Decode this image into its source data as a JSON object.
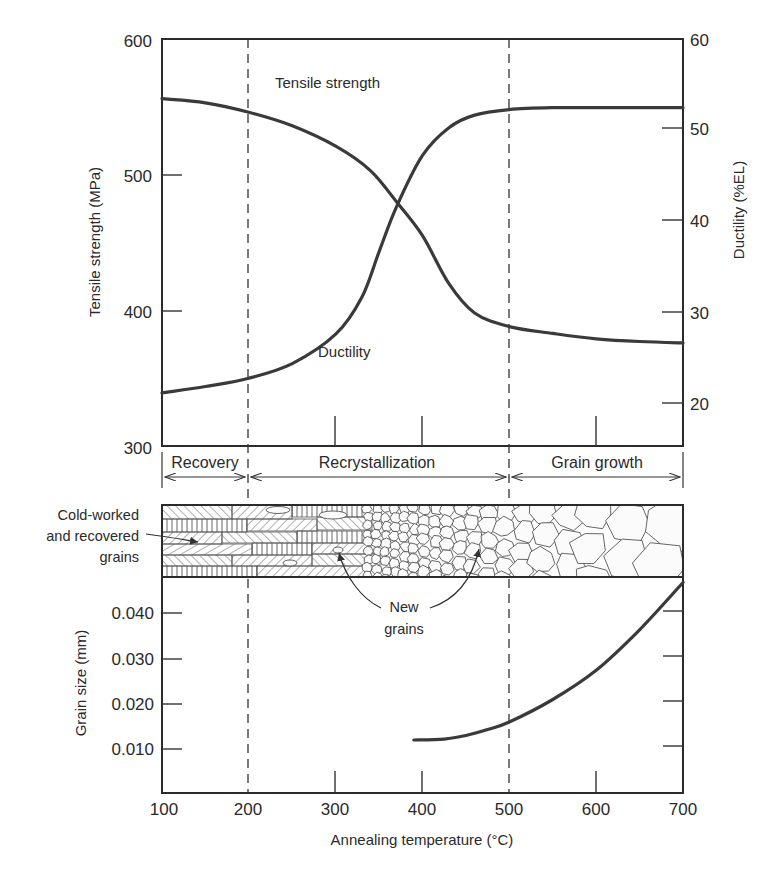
{
  "chart_data": [
    {
      "type": "line",
      "title": "",
      "xlabel": "Annealing temperature (°C)",
      "xlim": [
        100,
        700
      ],
      "x_ticks": [
        100,
        200,
        300,
        400,
        500,
        600,
        700
      ],
      "ylabel_left": "Tensile strength (MPa)",
      "ylim_left": [
        300,
        600
      ],
      "y_ticks_left": [
        300,
        400,
        500,
        600
      ],
      "ylabel_right": "Ductility (%EL)",
      "ylim_right": [
        15.5,
        60
      ],
      "y_ticks_right": [
        20,
        30,
        40,
        50,
        60
      ],
      "grid": false,
      "series": [
        {
          "name": "Tensile strength",
          "axis": "left",
          "x": [
            100,
            150,
            200,
            250,
            300,
            340,
            370,
            400,
            430,
            460,
            500,
            550,
            600,
            650,
            700
          ],
          "values": [
            556,
            553,
            546,
            536,
            521,
            503,
            480,
            455,
            420,
            398,
            388,
            383,
            379,
            377,
            376
          ]
        },
        {
          "name": "Ductility",
          "axis": "right",
          "x": [
            100,
            150,
            200,
            250,
            300,
            330,
            350,
            370,
            400,
            430,
            460,
            500,
            550,
            600,
            650,
            700
          ],
          "values": [
            21.1,
            21.8,
            22.7,
            24.3,
            27.5,
            31.5,
            36.5,
            41.4,
            47,
            50,
            51.4,
            52.0,
            52.2,
            52.2,
            52.2,
            52.2
          ]
        }
      ],
      "annotations": [
        {
          "text": "Tensile strength",
          "near_x": 265,
          "near_y_left": 573
        },
        {
          "text": "Ductility",
          "near_x": 293,
          "near_y_left": 342
        }
      ],
      "vertical_dashed_lines": [
        200,
        500
      ]
    },
    {
      "type": "line",
      "title": "",
      "xlabel": "Annealing temperature (°C)",
      "xlim": [
        100,
        700
      ],
      "x_ticks": [
        100,
        200,
        300,
        400,
        500,
        600,
        700
      ],
      "ylabel": "Grain size (mm)",
      "ylim": [
        0,
        0.048
      ],
      "y_ticks": [
        0.01,
        0.02,
        0.03,
        0.04
      ],
      "grid": false,
      "series": [
        {
          "name": "Grain size",
          "x": [
            390,
            425,
            450,
            475,
            500,
            550,
            600,
            650,
            700
          ],
          "values": [
            0.012,
            0.0122,
            0.013,
            0.0143,
            0.016,
            0.021,
            0.0275,
            0.0365,
            0.047
          ]
        }
      ],
      "vertical_dashed_lines": [
        200,
        500
      ]
    }
  ],
  "axes": {
    "left_ticks": [
      "600",
      "500",
      "400",
      "300"
    ],
    "right_ticks": [
      "60",
      "50",
      "40",
      "30",
      "20"
    ],
    "grain_ticks": [
      "0.040",
      "0.030",
      "0.020",
      "0.010"
    ],
    "x_ticks": [
      "100",
      "200",
      "300",
      "400",
      "500",
      "600",
      "700"
    ],
    "left_title": "Tensile strength (MPa)",
    "right_title": "Ductility (%EL)",
    "grain_title": "Grain size (mm)",
    "x_title": "Annealing temperature (°C)"
  },
  "curve_labels": {
    "tensile": "Tensile strength",
    "ductility": "Ductility"
  },
  "stages": {
    "recovery": "Recovery",
    "recrystallization": "Recrystallization",
    "grain_growth": "Grain growth"
  },
  "microstructure": {
    "cold_worked_line1": "Cold-worked",
    "cold_worked_line2": "and recovered",
    "cold_worked_line3": "grains",
    "new_grains_line1": "New",
    "new_grains_line2": "grains"
  },
  "colors": {
    "ink": "#2b2b2b",
    "curve": "#3a3a3a",
    "background": "#ffffff"
  }
}
